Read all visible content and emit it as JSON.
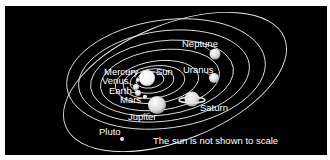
{
  "diagram": {
    "background": "#000000",
    "labels": {
      "sun": "Sun",
      "mercury": "Mercury",
      "venus": "Venus",
      "earth": "Earth",
      "mars": "Mars",
      "jupiter": "Jupiter",
      "saturn": "Saturn",
      "uranus": "Uranus",
      "neptune": "Neptune",
      "pluto": "Pluto"
    },
    "note": "The sun is not shown to scale",
    "bodies": [
      {
        "name": "Sun",
        "order": 0
      },
      {
        "name": "Mercury",
        "order": 1
      },
      {
        "name": "Venus",
        "order": 2
      },
      {
        "name": "Earth",
        "order": 3
      },
      {
        "name": "Mars",
        "order": 4
      },
      {
        "name": "Jupiter",
        "order": 5
      },
      {
        "name": "Saturn",
        "order": 6
      },
      {
        "name": "Uranus",
        "order": 7
      },
      {
        "name": "Neptune",
        "order": 8
      },
      {
        "name": "Pluto",
        "order": 9
      }
    ]
  }
}
